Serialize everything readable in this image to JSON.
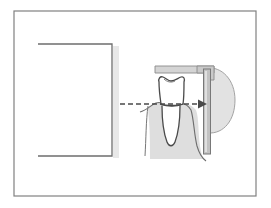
{
  "figure": {
    "caption": "",
    "background_color": "#ffffff",
    "frame": {
      "name": "outer-border",
      "x": 14,
      "y": 11,
      "width": 242,
      "height": 185,
      "stroke": "#808080",
      "stroke_width": 1.2,
      "fill": "#ffffff"
    },
    "elements": {
      "tube_head": {
        "label": "x-ray-tube-head",
        "description": "Open rectangle representing the x-ray source collimator, open on its left side",
        "path": "M 38 44 L 112 44 L 112 156 L 38 156",
        "stroke": "#6e6e6e",
        "stroke_width": 1.3,
        "fill": "none"
      },
      "tube_head_shadow": {
        "label": "tube-head-shadow",
        "x": 113,
        "y": 46,
        "width": 6,
        "height": 112,
        "fill": "#e8e8e8"
      },
      "beam_arrow": {
        "label": "central-beam-arrow",
        "x1": 120,
        "y1": 104,
        "x2": 198,
        "y2": 104,
        "stroke": "#4a4a4a",
        "stroke_width": 1.5,
        "dash": "5,3",
        "arrowhead_points": "198,99.5 207,104 198,108.5"
      },
      "holder_arm": {
        "label": "bite-block-holder-arm",
        "path": "M 155 66 L 214 66 L 214 73 L 197 73 L 197 73 L 155 73 Z",
        "fill": "#d4d4d4",
        "stroke": "#8a8a8a",
        "stroke_width": 0.9
      },
      "holder_corner": {
        "label": "holder-corner-joint",
        "path": "M 197 66 L 214 66 L 214 80 L 207 80 L 207 73 L 197 73 Z",
        "fill": "#c9c9c9",
        "stroke": "#8a8a8a",
        "stroke_width": 0.9
      },
      "sensor": {
        "label": "image-sensor-plate",
        "x": 203.5,
        "y": 69,
        "width": 7,
        "height": 85,
        "fill": "#c2c2c2",
        "stroke": "#787878",
        "stroke_width": 1.0
      },
      "sensor_highlight": {
        "label": "sensor-highlight",
        "x": 205,
        "y": 71,
        "width": 2,
        "height": 81,
        "fill": "#e0e0e0"
      },
      "cheek_tissue": {
        "label": "cheek-soft-tissue",
        "description": "Rounded soft tissue profile behind the sensor",
        "path": "M 206 68 C 222 66 235 80 235 100 C 235 120 224 134 208 133 L 206 133 Z",
        "fill": "#e2e2e2",
        "stroke": "#9a9a9a",
        "stroke_width": 0.9
      },
      "gum_tissue": {
        "label": "gingival-soft-tissue",
        "description": "Shaded gum and alveolar tissue below the gumline",
        "path": "M 148 108 C 152 104 158 103 163 104 L 180 104 C 186 103 192 105 196 110 C 199 118 198 132 200 146 C 201 152 202 156 203 159 L 150 159 C 150 148 150 132 149 122 Z",
        "fill": "#dedede",
        "stroke": "none"
      },
      "gum_line_left": {
        "label": "gumline-contour-left",
        "path": "M 140 112 C 147 110 151 105 156 103 C 160 102 163 103 165 105",
        "stroke": "#6e6e6e",
        "stroke_width": 1.1,
        "fill": "none"
      },
      "gum_line_right": {
        "label": "gumline-contour-right",
        "path": "M 180 104 C 184 103 188 105 191 110 C 194 120 194 134 197 146 C 199 153 202 158 206 161",
        "stroke": "#6e6e6e",
        "stroke_width": 1.1,
        "fill": "none"
      },
      "gum_sulcus_left": {
        "label": "gingival-sulcus-left",
        "path": "M 148 106 C 146 120 146 140 145 156",
        "stroke": "#777777",
        "stroke_width": 1.0,
        "fill": "none"
      },
      "tooth_crown": {
        "label": "tooth-crown",
        "description": "Enamel crown of a mandibular molar with occlusal groove",
        "path": "M 159 82 C 158 79 160 76 163 77 C 166 78 168 81 171 81 C 175 81 178 78 181 77 C 184 76 185 79 184 82 C 184 90 184 98 183 104 C 178 106 166 106 161 104 C 160 97 159 89 159 82 Z",
        "fill": "#ffffff",
        "stroke": "#4a4a4a",
        "stroke_width": 1.3
      },
      "tooth_root": {
        "label": "tooth-root",
        "description": "Single root extending below the cementoenamel junction",
        "path": "M 162 106 C 162 118 164 134 167 142 C 169 147 173 147 175 142 C 178 134 180 118 180 106",
        "fill": "#ffffff",
        "stroke": "#4a4a4a",
        "stroke_width": 1.3
      },
      "cej_line": {
        "label": "cementoenamel-junction-line",
        "path": "M 160 104 C 168 107 176 107 183 104",
        "stroke": "#4a4a4a",
        "stroke_width": 1.1,
        "fill": "none"
      },
      "occlusal_groove": {
        "label": "occlusal-groove",
        "path": "M 164 79 C 167 82 171 83 175 81",
        "stroke": "#6e6e6e",
        "stroke_width": 0.9,
        "fill": "none"
      }
    }
  }
}
